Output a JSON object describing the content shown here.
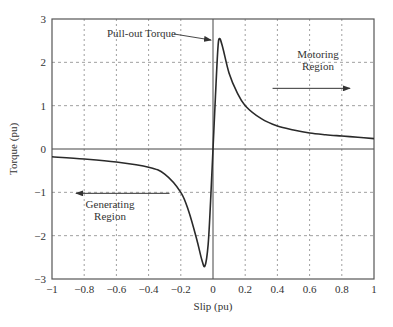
{
  "chart_data": {
    "type": "line",
    "title": "",
    "xlabel": "Slip (pu)",
    "ylabel": "Torque (pu)",
    "xlim": [
      -1,
      1
    ],
    "ylim": [
      -3,
      3
    ],
    "grid": true,
    "x_ticks": [
      -1,
      -0.8,
      -0.6,
      -0.4,
      -0.2,
      0,
      0.2,
      0.4,
      0.6,
      0.8,
      1
    ],
    "x_tick_labels": [
      "−1",
      "−0.8",
      "−0.6",
      "−0.4",
      "−0.2",
      "0",
      "0.2",
      "0.4",
      "0.6",
      "0.8",
      "1"
    ],
    "y_ticks": [
      -3,
      -2,
      -1,
      0,
      1,
      2,
      3
    ],
    "y_tick_labels": [
      "−3",
      "−2",
      "−1",
      "0",
      "1",
      "2",
      "3"
    ],
    "series": [
      {
        "name": "Torque-slip characteristic",
        "x": [
          -1,
          -0.8,
          -0.6,
          -0.4,
          -0.3,
          -0.2,
          -0.15,
          -0.1,
          -0.07,
          -0.05,
          -0.03,
          -0.015,
          0,
          0.015,
          0.03,
          0.04,
          0.06,
          0.1,
          0.15,
          0.2,
          0.3,
          0.4,
          0.5,
          0.6,
          0.7,
          0.8,
          0.9,
          1
        ],
        "y": [
          -0.18,
          -0.23,
          -0.3,
          -0.42,
          -0.58,
          -1.0,
          -1.45,
          -2.1,
          -2.55,
          -2.7,
          -2.2,
          -1.2,
          0,
          1.2,
          2.3,
          2.55,
          2.35,
          1.75,
          1.3,
          1.0,
          0.7,
          0.53,
          0.44,
          0.37,
          0.33,
          0.3,
          0.27,
          0.24
        ]
      }
    ],
    "annotations": [
      {
        "text": "Pull-out Torque",
        "points_to": [
          0.03,
          2.55
        ]
      },
      {
        "text_lines": [
          "Motoring",
          "Region"
        ],
        "arrow_from": 0.37,
        "arrow_to": 0.85,
        "arrow_y": 1.4,
        "direction": "right"
      },
      {
        "text_lines": [
          "Generating",
          "Region"
        ],
        "arrow_from": -0.27,
        "arrow_to": -0.85,
        "arrow_y": -1.0,
        "direction": "left"
      }
    ],
    "legend": null
  },
  "colors": {
    "curve": "#2a2a2a",
    "axis": "#555555",
    "grid": "#888888",
    "text": "#333333"
  }
}
